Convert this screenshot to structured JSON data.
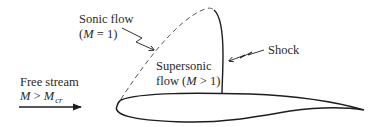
{
  "diagram": {
    "type": "airfoil-supercritical-flow",
    "colors": {
      "line": "#1e1e1e",
      "text": "#2a2a2a",
      "background": "#ffffff"
    },
    "labels": {
      "sonic_flow": {
        "line1": "Sonic flow",
        "line2_open": "(",
        "line2_var": "M",
        "line2_rest": " = 1)"
      },
      "shock": "Shock",
      "supersonic": {
        "line1": "Supersonic",
        "line2_pre": "flow (",
        "line2_var": "M",
        "line2_rest": " > 1)"
      },
      "free_stream": {
        "line1": "Free stream",
        "line2_var": "M",
        "line2_op": " > ",
        "line2_var2": "M",
        "line2_sub": "cr"
      }
    },
    "elements": {
      "sonic_line": "dashed",
      "shock_line": "solid",
      "free_stream_arrow": "arrow-right"
    }
  }
}
